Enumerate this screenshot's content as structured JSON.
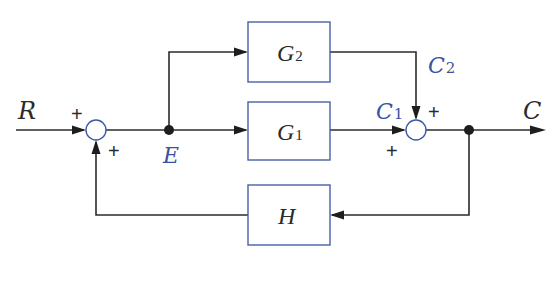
{
  "diagram": {
    "type": "block-diagram",
    "blocks": {
      "g2": {
        "main": "G",
        "sub": "2"
      },
      "g1": {
        "main": "G",
        "sub": "1"
      },
      "h": {
        "main": "H"
      }
    },
    "signals": {
      "input": "R",
      "error": "E",
      "c1": {
        "main": "C",
        "sub": "1"
      },
      "c2": {
        "main": "C",
        "sub": "2"
      },
      "output": "C"
    },
    "signs": {
      "sum1_input": "+",
      "sum1_feedback": "+",
      "sum2_c2": "+",
      "sum2_c1": "+"
    },
    "colors": {
      "line": "#2b2b2b",
      "block_border": "#4a60a8",
      "signal_label_blue": "#3a52a0"
    }
  }
}
